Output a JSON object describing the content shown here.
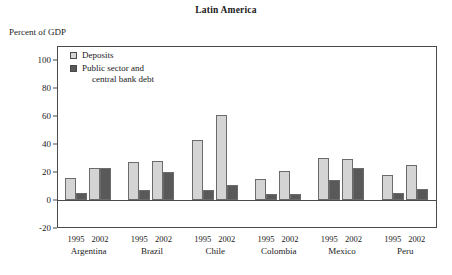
{
  "figure": {
    "title": "Latin America",
    "ylabel": "Percent of GDP"
  },
  "legend": {
    "items": [
      {
        "label": "Deposits",
        "label_line2": "",
        "color": "#d4d4d4",
        "key": "deposits"
      },
      {
        "label": "Public sector and",
        "label_line2": "central bank debt",
        "color": "#595959",
        "key": "debt"
      }
    ]
  },
  "axis": {
    "yticks": [
      "-20",
      "0",
      "20",
      "40",
      "60",
      "80",
      "100"
    ],
    "ymin": -20,
    "ymax": 110,
    "years": [
      "1995",
      "2002"
    ]
  },
  "chart_data": {
    "type": "bar",
    "title": "Latin America",
    "xlabel": "",
    "ylabel": "Percent of GDP",
    "ylim": [
      -20,
      110
    ],
    "yticks": [
      -20,
      0,
      20,
      40,
      60,
      80,
      100
    ],
    "grid": false,
    "legend_position": "top-left-inside",
    "categories": [
      "Argentina 1995",
      "Argentina 2002",
      "Brazil 1995",
      "Brazil 2002",
      "Chile 1995",
      "Chile 2002",
      "Colombia 1995",
      "Colombia 2002",
      "Mexico 1995",
      "Mexico 2002",
      "Peru 1995",
      "Peru 2002"
    ],
    "countries": [
      "Argentina",
      "Brazil",
      "Chile",
      "Colombia",
      "Mexico",
      "Peru"
    ],
    "years": [
      "1995",
      "2002"
    ],
    "series": [
      {
        "name": "Deposits",
        "color": "#d4d4d4",
        "values": [
          16,
          23,
          27,
          28,
          43,
          61,
          15,
          21,
          30,
          29,
          18,
          25
        ]
      },
      {
        "name": "Public sector and central bank debt",
        "color": "#595959",
        "values": [
          5,
          23,
          7,
          20,
          7,
          11,
          4,
          4,
          14,
          23,
          5,
          8
        ]
      }
    ]
  },
  "groups": [
    {
      "country": "Argentina",
      "bars": [
        {
          "year": "1995",
          "deposits": 16,
          "debt": 5
        },
        {
          "year": "2002",
          "deposits": 23,
          "debt": 23
        }
      ]
    },
    {
      "country": "Brazil",
      "bars": [
        {
          "year": "1995",
          "deposits": 27,
          "debt": 7
        },
        {
          "year": "2002",
          "deposits": 28,
          "debt": 20
        }
      ]
    },
    {
      "country": "Chile",
      "bars": [
        {
          "year": "1995",
          "deposits": 43,
          "debt": 7
        },
        {
          "year": "2002",
          "deposits": 61,
          "debt": 11
        }
      ]
    },
    {
      "country": "Colombia",
      "bars": [
        {
          "year": "1995",
          "deposits": 15,
          "debt": 4
        },
        {
          "year": "2002",
          "deposits": 21,
          "debt": 4
        }
      ]
    },
    {
      "country": "Mexico",
      "bars": [
        {
          "year": "1995",
          "deposits": 30,
          "debt": 14
        },
        {
          "year": "2002",
          "deposits": 29,
          "debt": 23
        }
      ]
    },
    {
      "country": "Peru",
      "bars": [
        {
          "year": "1995",
          "deposits": 18,
          "debt": 5
        },
        {
          "year": "2002",
          "deposits": 25,
          "debt": 8
        }
      ]
    }
  ]
}
